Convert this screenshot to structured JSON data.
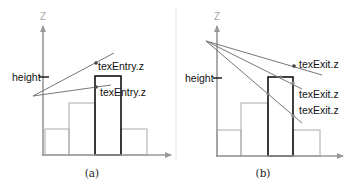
{
  "colors": {
    "axis": "#999999",
    "bar_light": "#aaaaaa",
    "bar_highlight": "#111111",
    "ray": "#777777",
    "dot": "#444444",
    "divider": "#e6e6e6"
  },
  "panels": [
    {
      "id": "a",
      "caption": "(a)",
      "axis_label": "Z",
      "height_label": "height",
      "ray_labels": [
        "texEntry.z",
        "texEntry.z"
      ]
    },
    {
      "id": "b",
      "caption": "(b)",
      "axis_label": "Z",
      "height_label": "height",
      "ray_labels": [
        "texExit.z",
        "texExit.z",
        "texExit.z"
      ]
    }
  ]
}
